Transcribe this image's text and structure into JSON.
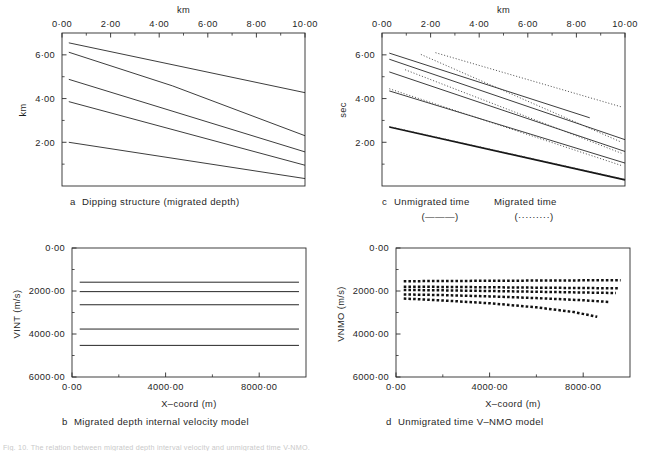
{
  "figure": {
    "footnote": "Fig. 10.  The relation between migrated depth interval velocity and unmigrated time V-NMO."
  },
  "chart_data": [
    {
      "id": "a",
      "type": "line",
      "title": "a  Dipping structure (migrated depth)",
      "caption_letter": "a",
      "caption_text": "Dipping structure (migrated depth)",
      "xlabel": "km",
      "ylabel": "km",
      "xlim": [
        0,
        10
      ],
      "ylim": [
        7.0,
        0
      ],
      "x_axis_position": "top",
      "y_axis_direction": "down",
      "xticks": [
        0,
        2,
        4,
        6,
        8,
        10
      ],
      "xticklabels": [
        "0·00",
        "2·00",
        "4·00",
        "6·00",
        "8·00",
        "10·00"
      ],
      "yticks": [
        2,
        4,
        6
      ],
      "yticklabels": [
        "2·00",
        "4·00",
        "6·00"
      ],
      "x_minor_ticks": [
        1,
        3,
        5,
        7,
        9
      ],
      "y_minor_ticks": [
        1,
        3,
        5
      ],
      "grid": false,
      "legend": "none",
      "series": [
        {
          "name": "horizon 1",
          "style": "solid",
          "x": [
            0.28,
            10.0
          ],
          "y": [
            2.0,
            0.34
          ]
        },
        {
          "name": "horizon 2",
          "style": "solid",
          "x": [
            0.28,
            10.0
          ],
          "y": [
            3.86,
            0.95
          ]
        },
        {
          "name": "horizon 3",
          "style": "solid",
          "x": [
            0.28,
            10.0
          ],
          "y": [
            4.88,
            1.56
          ]
        },
        {
          "name": "horizon 4",
          "style": "solid",
          "x": [
            0.28,
            4.55,
            10.0
          ],
          "y": [
            6.12,
            4.58,
            2.3
          ]
        },
        {
          "name": "horizon 5",
          "style": "solid",
          "x": [
            0.28,
            10.0
          ],
          "y": [
            6.55,
            4.27
          ]
        }
      ]
    },
    {
      "id": "c",
      "type": "line",
      "title": "c  Unmigrated time / Migrated time",
      "caption_letter": "c",
      "caption_text": "Unmigrated time",
      "caption_text_2": "Migrated time",
      "xlabel": "km",
      "ylabel": "sec",
      "xlim": [
        0,
        10
      ],
      "ylim": [
        7.0,
        0
      ],
      "x_axis_position": "top",
      "y_axis_direction": "down",
      "xticks": [
        0,
        2,
        4,
        6,
        8,
        10
      ],
      "xticklabels": [
        "0·00",
        "2·00",
        "4·00",
        "6·00",
        "8·00",
        "10·00"
      ],
      "yticks": [
        2,
        4,
        6
      ],
      "yticklabels": [
        "2·00",
        "4·00",
        "6·00"
      ],
      "x_minor_ticks": [
        1,
        3,
        5,
        7,
        9
      ],
      "y_minor_ticks": [
        1,
        3,
        5
      ],
      "grid": false,
      "legend": {
        "position": "below-axes",
        "entries": [
          {
            "label": "Unmigrated time",
            "marker": "(———)",
            "style": "solid"
          },
          {
            "label": "Migrated time",
            "marker": "(·········)",
            "style": "dotted"
          }
        ]
      },
      "series": [
        {
          "name": "unmigrated 1",
          "style": "bold",
          "x": [
            0.3,
            10.0
          ],
          "y": [
            2.7,
            0.28
          ]
        },
        {
          "name": "unmigrated 2",
          "style": "solid",
          "x": [
            0.3,
            10.0
          ],
          "y": [
            4.35,
            1.05
          ]
        },
        {
          "name": "unmigrated 3",
          "style": "solid",
          "x": [
            0.3,
            10.0
          ],
          "y": [
            5.22,
            1.58
          ]
        },
        {
          "name": "unmigrated 4",
          "style": "solid",
          "x": [
            0.3,
            10.0
          ],
          "y": [
            5.8,
            2.12
          ]
        },
        {
          "name": "unmigrated 5",
          "style": "solid",
          "x": [
            0.3,
            8.55
          ],
          "y": [
            6.08,
            3.12
          ]
        },
        {
          "name": "migrated 1",
          "style": "dotted",
          "x": [
            0.3,
            10.0
          ],
          "y": [
            2.72,
            0.3
          ]
        },
        {
          "name": "migrated 2",
          "style": "dotted",
          "x": [
            0.3,
            9.9
          ],
          "y": [
            4.45,
            0.92
          ]
        },
        {
          "name": "migrated 3",
          "style": "dotted",
          "x": [
            0.95,
            9.85
          ],
          "y": [
            5.32,
            1.5
          ]
        },
        {
          "name": "migrated 4",
          "style": "dotted",
          "x": [
            1.6,
            9.8
          ],
          "y": [
            6.02,
            2.03
          ]
        },
        {
          "name": "migrated 5",
          "style": "dotted",
          "x": [
            2.2,
            9.85
          ],
          "y": [
            6.1,
            3.62
          ]
        }
      ]
    },
    {
      "id": "b",
      "type": "line",
      "title": "b  Migrated depth internal velocity model",
      "caption_letter": "b",
      "caption_text": "Migrated depth internal velocity model",
      "xlabel": "X–coord (m)",
      "ylabel": "VINT (m/s)",
      "xlim": [
        0,
        10000
      ],
      "ylim": [
        0,
        6000
      ],
      "x_axis_position": "bottom",
      "y_axis_direction": "up",
      "xticks": [
        0,
        4000,
        8000
      ],
      "xticklabels": [
        "0·00",
        "4000·00",
        "8000·00"
      ],
      "yticks": [
        0,
        2000,
        4000,
        6000
      ],
      "yticklabels": [
        "0·00",
        "2000·00",
        "4000·00",
        "6000·00"
      ],
      "x_minor_ticks": [
        2000,
        6000
      ],
      "y_minor_ticks": [
        1000,
        3000,
        5000
      ],
      "grid": false,
      "legend": "none",
      "series": [
        {
          "name": "layer 1 VINT",
          "style": "hline",
          "x": [
            330,
            9700
          ],
          "y": [
            1590,
            1590
          ]
        },
        {
          "name": "layer 2 VINT",
          "style": "hline",
          "x": [
            330,
            9700
          ],
          "y": [
            2030,
            2030
          ]
        },
        {
          "name": "layer 3 VINT",
          "style": "hline",
          "x": [
            330,
            9700
          ],
          "y": [
            2640,
            2640
          ]
        },
        {
          "name": "layer 4 VINT",
          "style": "hline",
          "x": [
            330,
            9700
          ],
          "y": [
            3770,
            3770
          ]
        },
        {
          "name": "layer 5 VINT",
          "style": "hline",
          "x": [
            330,
            9700
          ],
          "y": [
            4530,
            4530
          ]
        }
      ]
    },
    {
      "id": "d",
      "type": "line",
      "title": "d  Unmigrated time V-NMO model",
      "caption_letter": "d",
      "caption_text": "Unmigrated time V–NMO model",
      "xlabel": "X–coord (m)",
      "ylabel": "VNMO (m/s)",
      "xlim": [
        0,
        10000
      ],
      "ylim": [
        0,
        6000
      ],
      "x_axis_position": "bottom",
      "y_axis_direction": "up",
      "xticks": [
        0,
        4000,
        8000
      ],
      "xticklabels": [
        "0·00",
        "4000·00",
        "8000·00"
      ],
      "yticks": [
        0,
        2000,
        4000,
        6000
      ],
      "yticklabels": [
        "0·00",
        "2000·00",
        "4000·00",
        "6000·00"
      ],
      "x_minor_ticks": [
        2000,
        6000
      ],
      "y_minor_ticks": [
        1000,
        3000,
        5000
      ],
      "grid": false,
      "legend": "none",
      "series": [
        {
          "name": "VNMO 1",
          "style": "dots",
          "x": [
            330,
            2000,
            4000,
            6000,
            7600,
            8600
          ],
          "y": [
            2350,
            2440,
            2570,
            2760,
            2980,
            3200
          ]
        },
        {
          "name": "VNMO 2",
          "style": "dots",
          "x": [
            330,
            2000,
            4000,
            6000,
            8000,
            9100
          ],
          "y": [
            2160,
            2190,
            2250,
            2330,
            2430,
            2510
          ]
        },
        {
          "name": "VNMO 3",
          "style": "dots",
          "x": [
            330,
            2000,
            4000,
            6000,
            8000,
            9400
          ],
          "y": [
            1950,
            1970,
            2000,
            2035,
            2070,
            2095
          ]
        },
        {
          "name": "VNMO 4",
          "style": "dots",
          "x": [
            330,
            2000,
            4000,
            6000,
            8000,
            9500
          ],
          "y": [
            1800,
            1810,
            1825,
            1845,
            1862,
            1875
          ]
        },
        {
          "name": "VNMO 5",
          "style": "dots",
          "x": [
            330,
            2000,
            4000,
            6000,
            8000,
            9600
          ],
          "y": [
            1545,
            1535,
            1525,
            1515,
            1505,
            1498
          ]
        }
      ]
    }
  ]
}
